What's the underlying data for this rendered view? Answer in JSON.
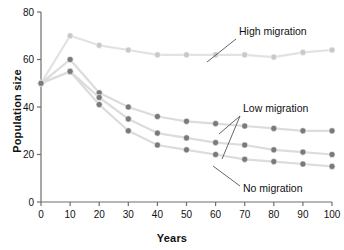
{
  "chart_data": {
    "type": "line",
    "title": "",
    "xlabel": "Years",
    "ylabel": "Population size",
    "xlim": [
      0,
      100
    ],
    "ylim": [
      0,
      80
    ],
    "xticks": [
      0,
      10,
      20,
      30,
      40,
      50,
      60,
      70,
      80,
      90,
      100
    ],
    "yticks": [
      0,
      20,
      40,
      60,
      80
    ],
    "grid": false,
    "legend_position": "inline-annotations",
    "x": [
      0,
      10,
      20,
      30,
      40,
      50,
      60,
      70,
      80,
      90,
      100
    ],
    "series": [
      {
        "name": "High migration",
        "color": "#c9c9c9",
        "values": [
          50,
          70,
          66,
          64,
          62,
          62,
          62,
          62,
          61,
          63,
          64
        ]
      },
      {
        "name": "Low migration (upper)",
        "color": "#7a7a7a",
        "values": [
          50,
          60,
          46,
          40,
          36,
          34,
          33,
          32,
          31,
          30,
          30
        ]
      },
      {
        "name": "Low migration (lower)",
        "color": "#7a7a7a",
        "values": [
          50,
          55,
          44,
          35,
          29,
          27,
          25,
          24,
          22,
          21,
          20
        ]
      },
      {
        "name": "No migration",
        "color": "#7a7a7a",
        "values": [
          50,
          55,
          41,
          30,
          24,
          22,
          20,
          18,
          17,
          16,
          15
        ]
      }
    ],
    "annotations": [
      {
        "label": "High migration",
        "target_x": 60,
        "target_series": 0
      },
      {
        "label": "Low migration",
        "target_x": 62,
        "target_series": 1
      },
      {
        "label": "No migration",
        "target_x": 62,
        "target_series": 3
      }
    ]
  }
}
